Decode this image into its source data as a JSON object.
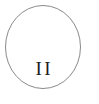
{
  "figure": {
    "type": "circle-with-label",
    "canvas": {
      "width": 99,
      "height": 104,
      "background_color": "#ffffff"
    },
    "shape": {
      "name": "circle-outline",
      "center_x": 43,
      "center_y": 47,
      "radius_x": 38,
      "radius_y": 42,
      "stroke_color": "#8a8a8a",
      "stroke_width": 1,
      "fill": "none"
    },
    "label": {
      "text": "II",
      "color": "#1d1d1d",
      "font_size_px": 19,
      "letter_spacing_px": 2.5,
      "center_x": 43,
      "baseline_y": 78,
      "style": "serif-roman-numeral"
    }
  }
}
